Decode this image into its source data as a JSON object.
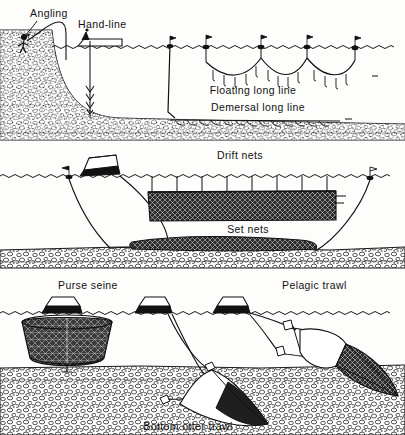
{
  "figure": {
    "type": "line-illustration",
    "width": 405,
    "height": 435,
    "background_color": "#fdfdfc",
    "ink_color": "#111111",
    "panel_count": 3
  },
  "panels": [
    {
      "id": "panel-lines",
      "index": 1,
      "name": "Line fishing methods",
      "labels": [
        {
          "id": "angling",
          "text": "Angling",
          "x": 30,
          "y": 17,
          "anchor": "start"
        },
        {
          "id": "hand-line",
          "text": "Hand-line",
          "x": 78,
          "y": 28,
          "anchor": "start"
        },
        {
          "id": "floating-long-line",
          "text": "Floating long line",
          "x": 243,
          "y": 93,
          "anchor": "middle"
        },
        {
          "id": "demersal-long-line",
          "text": "Demersal long line",
          "x": 258,
          "y": 110,
          "anchor": "middle"
        }
      ],
      "water_surface_y": 47,
      "seabed_top_y": 116,
      "seabed_bottom_y": 140,
      "buoy_count": 4,
      "gear": [
        "angling rod",
        "hand-line with weighted hooks",
        "floating long line with flagged buoys",
        "demersal long line on seabed"
      ]
    },
    {
      "id": "panel-nets-static",
      "index": 2,
      "name": "Drift and set nets",
      "labels": [
        {
          "id": "drift-nets",
          "text": "Drift nets",
          "x": 240,
          "y": 158,
          "anchor": "middle"
        },
        {
          "id": "set-nets",
          "text": "Set nets",
          "x": 248,
          "y": 222,
          "anchor": "middle"
        }
      ],
      "water_surface_y": 176,
      "seabed_top_y": 245,
      "seabed_bottom_y": 266,
      "vessel_count": 1,
      "gear": [
        "drift net curtain suspended from surface floats",
        "set nets laid along seabed"
      ]
    },
    {
      "id": "panel-trawls",
      "index": 3,
      "name": "Seine and trawl methods",
      "labels": [
        {
          "id": "purse-seine",
          "text": "Purse seine",
          "x": 62,
          "y": 288,
          "anchor": "start"
        },
        {
          "id": "pelagic-trawl",
          "text": "Pelagic  trawl",
          "x": 285,
          "y": 288,
          "anchor": "start"
        },
        {
          "id": "bottom-otter-trawl",
          "text": "Bottom otter trawl",
          "x": 190,
          "y": 429,
          "anchor": "middle"
        }
      ],
      "water_surface_y": 313,
      "seabed_top_y": 365,
      "seabed_bottom_y": 435,
      "vessel_count": 3,
      "gear": [
        "purse seine encircling net",
        "pelagic trawl with otter boards",
        "bottom otter trawl on seabed"
      ]
    }
  ],
  "colors": {
    "ink": "#111111",
    "net_fill": "#2b2b2b",
    "paper": "#fdfdfc",
    "seabed_stipple": "#3a3a3a"
  }
}
